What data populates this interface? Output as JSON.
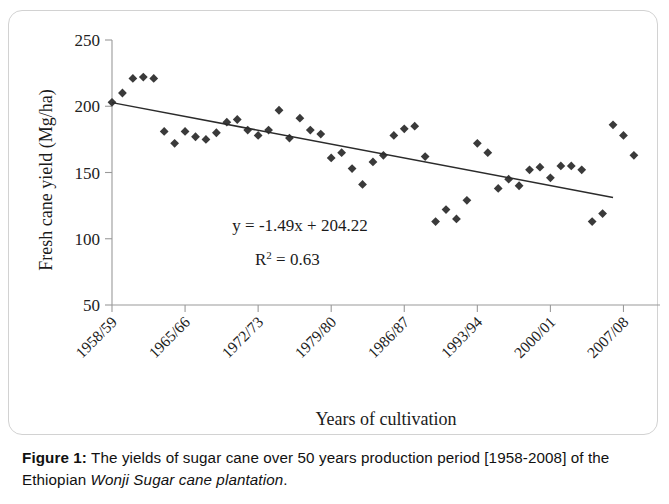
{
  "figure": {
    "caption_label": "Figure 1:",
    "caption_text_1": " The yields of sugar cane over 50 years production period [1958-2008] of the Ethiopian ",
    "caption_italic": "Wonji Sugar cane plantation",
    "caption_text_2": "."
  },
  "chart_data": {
    "type": "scatter",
    "title": "",
    "xlabel": "Years of cultivation",
    "ylabel": "Fresh cane yield (Mg/ha)",
    "ylim": [
      50,
      250
    ],
    "ytick_labels": [
      "250",
      "200",
      "150",
      "100",
      "50"
    ],
    "ytick_values": [
      250,
      200,
      150,
      100,
      50
    ],
    "xtick_labels": [
      "1958/59",
      "1965/66",
      "1972/73",
      "1979/80",
      "1986/87",
      "1993/94",
      "2000/01",
      "2007/08"
    ],
    "xtick_years": [
      1958,
      1965,
      1972,
      1979,
      1986,
      1993,
      2000,
      2007
    ],
    "grid": false,
    "legend": "none",
    "marker": "diamond",
    "marker_color": "#3a3a3a",
    "trendline": {
      "equation": "y = -1.49x + 204.22",
      "r_squared_label": "R",
      "r_squared_sup": "2",
      "r_squared_value": " = 0.63",
      "slope": -1.49,
      "intercept": 204.22,
      "r2": 0.63,
      "color": "#2b2b2b"
    },
    "x": [
      1958,
      1959,
      1960,
      1961,
      1962,
      1963,
      1964,
      1965,
      1966,
      1967,
      1968,
      1969,
      1970,
      1971,
      1972,
      1973,
      1974,
      1975,
      1976,
      1977,
      1978,
      1979,
      1980,
      1981,
      1982,
      1983,
      1984,
      1985,
      1986,
      1987,
      1988,
      1989,
      1990,
      1991,
      1992,
      1993,
      1994,
      1995,
      1996,
      1997,
      1998,
      1999,
      2000,
      2001,
      2002,
      2003,
      2004,
      2005,
      2006,
      2007,
      2008
    ],
    "values": [
      203,
      210,
      221,
      222,
      221,
      181,
      172,
      181,
      177,
      175,
      180,
      188,
      190,
      182,
      178,
      182,
      197,
      176,
      191,
      182,
      179,
      161,
      165,
      153,
      141,
      158,
      163,
      178,
      183,
      185,
      162,
      113,
      122,
      115,
      129,
      172,
      165,
      138,
      145,
      140,
      152,
      154,
      146,
      155,
      155,
      152,
      113,
      119,
      186,
      178,
      163
    ],
    "points": [
      {
        "year": "1958/59",
        "yield": 203
      },
      {
        "year": "1959/60",
        "yield": 210
      },
      {
        "year": "1960/61",
        "yield": 221
      },
      {
        "year": "1961/62",
        "yield": 222
      },
      {
        "year": "1962/63",
        "yield": 221
      },
      {
        "year": "1963/64",
        "yield": 181
      },
      {
        "year": "1964/65",
        "yield": 172
      },
      {
        "year": "1965/66",
        "yield": 181
      },
      {
        "year": "1966/67",
        "yield": 177
      },
      {
        "year": "1967/68",
        "yield": 175
      },
      {
        "year": "1968/69",
        "yield": 180
      },
      {
        "year": "1969/70",
        "yield": 188
      },
      {
        "year": "1970/71",
        "yield": 190
      },
      {
        "year": "1971/72",
        "yield": 182
      },
      {
        "year": "1972/73",
        "yield": 178
      },
      {
        "year": "1973/74",
        "yield": 182
      },
      {
        "year": "1974/75",
        "yield": 197
      },
      {
        "year": "1975/76",
        "yield": 176
      },
      {
        "year": "1976/77",
        "yield": 191
      },
      {
        "year": "1977/78",
        "yield": 182
      },
      {
        "year": "1978/79",
        "yield": 179
      },
      {
        "year": "1979/80",
        "yield": 161
      },
      {
        "year": "1980/81",
        "yield": 165
      },
      {
        "year": "1981/82",
        "yield": 153
      },
      {
        "year": "1982/83",
        "yield": 141
      },
      {
        "year": "1983/84",
        "yield": 158
      },
      {
        "year": "1984/85",
        "yield": 163
      },
      {
        "year": "1985/86",
        "yield": 178
      },
      {
        "year": "1986/87",
        "yield": 183
      },
      {
        "year": "1987/88",
        "yield": 185
      },
      {
        "year": "1988/89",
        "yield": 162
      },
      {
        "year": "1989/90",
        "yield": 113
      },
      {
        "year": "1990/91",
        "yield": 122
      },
      {
        "year": "1991/92",
        "yield": 115
      },
      {
        "year": "1992/93",
        "yield": 129
      },
      {
        "year": "1993/94",
        "yield": 172
      },
      {
        "year": "1994/95",
        "yield": 165
      },
      {
        "year": "1995/96",
        "yield": 138
      },
      {
        "year": "1996/97",
        "yield": 145
      },
      {
        "year": "1997/98",
        "yield": 140
      },
      {
        "year": "1998/99",
        "yield": 152
      },
      {
        "year": "1999/00",
        "yield": 154
      },
      {
        "year": "2000/01",
        "yield": 146
      },
      {
        "year": "2001/02",
        "yield": 155
      },
      {
        "year": "2002/03",
        "yield": 155
      },
      {
        "year": "2003/04",
        "yield": 152
      },
      {
        "year": "2004/05",
        "yield": 113
      },
      {
        "year": "2005/06",
        "yield": 119
      }
    ]
  }
}
